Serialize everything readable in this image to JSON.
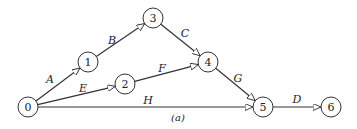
{
  "diagram": {
    "caption": "(a)",
    "nodes": [
      {
        "id": "0",
        "label": "0",
        "x": 28,
        "y": 107
      },
      {
        "id": "1",
        "label": "1",
        "x": 88,
        "y": 62
      },
      {
        "id": "2",
        "label": "2",
        "x": 125,
        "y": 84
      },
      {
        "id": "3",
        "label": "3",
        "x": 153,
        "y": 18
      },
      {
        "id": "4",
        "label": "4",
        "x": 208,
        "y": 62
      },
      {
        "id": "5",
        "label": "5",
        "x": 263,
        "y": 107
      },
      {
        "id": "6",
        "label": "6",
        "x": 331,
        "y": 107
      }
    ],
    "edges": [
      {
        "from": "0",
        "to": "1",
        "label": "A",
        "lx": 50,
        "ly": 83
      },
      {
        "from": "1",
        "to": "3",
        "label": "B",
        "lx": 112,
        "ly": 44
      },
      {
        "from": "3",
        "to": "4",
        "label": "C",
        "lx": 185,
        "ly": 37
      },
      {
        "from": "0",
        "to": "2",
        "label": "E",
        "lx": 83,
        "ly": 92
      },
      {
        "from": "2",
        "to": "4",
        "label": "F",
        "lx": 162,
        "ly": 72
      },
      {
        "from": "4",
        "to": "5",
        "label": "G",
        "lx": 238,
        "ly": 82
      },
      {
        "from": "0",
        "to": "5",
        "label": "H",
        "lx": 148,
        "ly": 104
      },
      {
        "from": "5",
        "to": "6",
        "label": "D",
        "lx": 297,
        "ly": 103
      }
    ]
  }
}
